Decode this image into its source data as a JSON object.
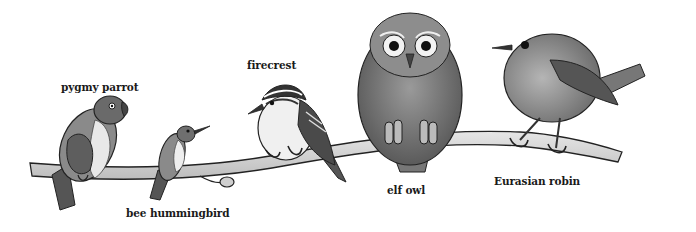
{
  "illustration": {
    "subject": "small birds perched on a branch, size comparison",
    "background_color": "#ffffff",
    "ink_color": "#1a1a1a",
    "branch_color": "#d4d4d4"
  },
  "labels": [
    {
      "key": "pygmy_parrot",
      "text": "pygmy parrot",
      "x": 61,
      "y": 81
    },
    {
      "key": "bee_hummingbird",
      "text": "bee hummingbird",
      "x": 126,
      "y": 207
    },
    {
      "key": "firecrest",
      "text": "firecrest",
      "x": 247,
      "y": 59
    },
    {
      "key": "elf_owl",
      "text": "elf owl",
      "x": 387,
      "y": 184
    },
    {
      "key": "eurasian_robin",
      "text": "Eurasian robin",
      "x": 494,
      "y": 175
    }
  ],
  "birds": [
    {
      "name": "pygmy parrot",
      "icon": "parrot-icon"
    },
    {
      "name": "bee hummingbird",
      "icon": "hummingbird-icon"
    },
    {
      "name": "firecrest",
      "icon": "firecrest-icon"
    },
    {
      "name": "elf owl",
      "icon": "owl-icon"
    },
    {
      "name": "Eurasian robin",
      "icon": "robin-icon"
    }
  ]
}
